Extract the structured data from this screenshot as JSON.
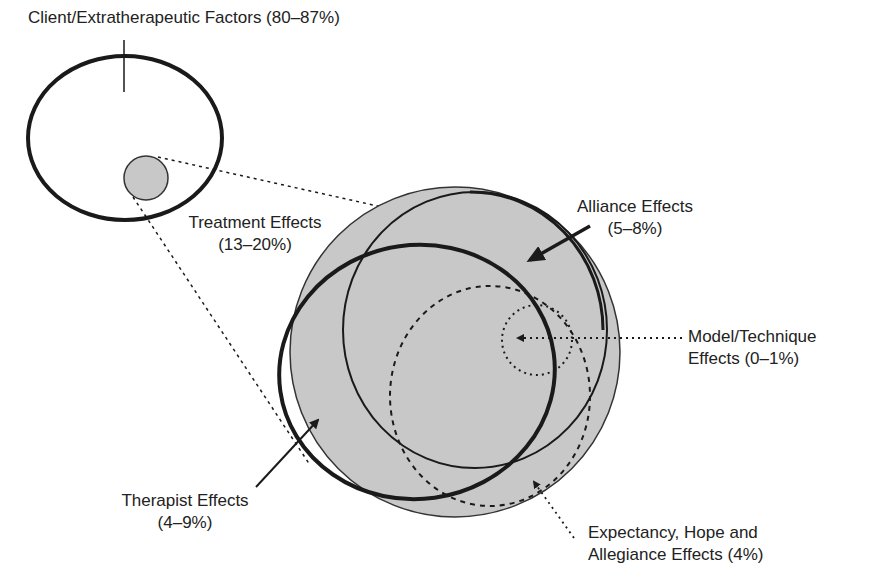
{
  "title": "",
  "labels": {
    "client": "Client/Extratherapeutic Factors (80–87%)",
    "treatment_line1": "Treatment Effects",
    "treatment_line2": "(13–20%)",
    "alliance_line1": "Alliance Effects",
    "alliance_line2": "(5–8%)",
    "model_line1": "Model/Technique",
    "model_line2": "Effects (0–1%)",
    "therapist_line1": "Therapist Effects",
    "therapist_line2": "(4–9%)",
    "expectancy_line1": "Expectancy, Hope and",
    "expectancy_line2": "Allegiance Effects (4%)"
  },
  "colors": {
    "fill": "#c8c8c8",
    "stroke": "#1a1a1a"
  }
}
